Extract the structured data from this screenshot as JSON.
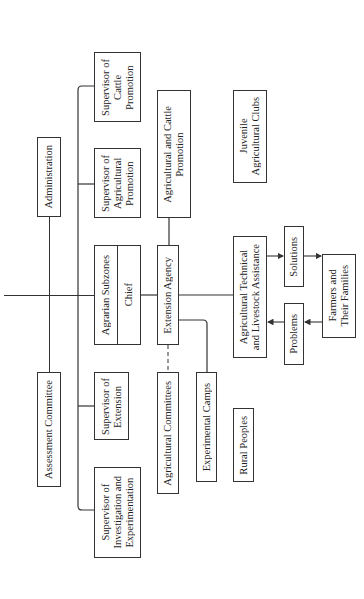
{
  "diagram": {
    "type": "organizational-chart",
    "orientation": "rotated-90-ccw",
    "nodes": {
      "administration": "Administration",
      "assessment_committee": "Assessment Committee",
      "supervisor_cattle": "Supervisor of\nCattle\nPromotion",
      "supervisor_agricultural": "Supervisor of\nAgricultural\nPromotion",
      "agrarian_subzones": "Agrarian Subzones",
      "agrarian_chief": "Chief",
      "supervisor_extension": "Supervisor of\nExtension",
      "supervisor_investigation": "Supervisor of\nInvestigation and\nExperimentation",
      "extension_agency": "Extension Agency",
      "ag_cattle_promotion": "Agricultural and Cattle\nPromotion",
      "agricultural_committees": "Agricultural Committees",
      "experimental_camps": "Experimental Camps",
      "juvenile_clubs": "Juvenile\nAgricultural Clubs",
      "technical_assistance": "Agricultural Technical\nand Livestock Assistance",
      "rural_peoples": "Rural Peoples",
      "solutions": "Solutions",
      "problems": "Problems",
      "farmers": "Farmers and\nTheir Families"
    },
    "edges": [
      {
        "from": "root",
        "to": "administration",
        "style": "solid"
      },
      {
        "from": "root",
        "to": "assessment_committee",
        "style": "solid"
      },
      {
        "from": "root",
        "to": "supervisor_cattle",
        "style": "solid"
      },
      {
        "from": "root",
        "to": "supervisor_agricultural",
        "style": "solid"
      },
      {
        "from": "root",
        "to": "supervisor_extension",
        "style": "solid"
      },
      {
        "from": "root",
        "to": "supervisor_investigation",
        "style": "solid"
      },
      {
        "from": "root",
        "to": "agrarian_subzones",
        "style": "solid"
      },
      {
        "from": "agrarian_subzones",
        "to": "extension_agency",
        "style": "solid"
      },
      {
        "from": "extension_agency",
        "to": "ag_cattle_promotion",
        "style": "solid"
      },
      {
        "from": "extension_agency",
        "to": "agricultural_committees",
        "style": "dashed"
      },
      {
        "from": "extension_agency",
        "to": "experimental_camps",
        "style": "solid"
      },
      {
        "from": "extension_agency",
        "to": "technical_assistance",
        "style": "solid"
      },
      {
        "from": "technical_assistance",
        "to": "solutions",
        "style": "arrow"
      },
      {
        "from": "solutions",
        "to": "farmers",
        "style": "arrow"
      },
      {
        "from": "farmers",
        "to": "problems",
        "style": "arrow"
      },
      {
        "from": "problems",
        "to": "technical_assistance",
        "style": "arrow"
      }
    ]
  }
}
